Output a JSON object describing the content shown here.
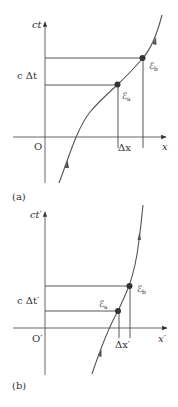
{
  "figure": {
    "panels": [
      {
        "id": "a",
        "caption": "(a)",
        "vertical_axis_label": "ct",
        "horizontal_axis_label": "x",
        "origin_label": "O",
        "time_interval_label": "c Δt",
        "space_interval_label": "Δx",
        "events": [
          {
            "name": "Ea",
            "label": "ℰ",
            "subscript": "a"
          },
          {
            "name": "Eb",
            "label": "ℰ",
            "subscript": "b"
          }
        ]
      },
      {
        "id": "b",
        "caption": "(b)",
        "vertical_axis_label": "ct′",
        "horizontal_axis_label": "x′",
        "origin_label": "O′",
        "time_interval_label": "c Δt′",
        "space_interval_label": "Δx′",
        "events": [
          {
            "name": "Ea",
            "label": "ℰ",
            "subscript": "a"
          },
          {
            "name": "Eb",
            "label": "ℰ",
            "subscript": "b"
          }
        ]
      }
    ]
  },
  "colors": {
    "axis": "#444444",
    "worldline": "#555555",
    "event_dot": "#333333",
    "guide_lines": "#444444",
    "text": "#333333"
  }
}
